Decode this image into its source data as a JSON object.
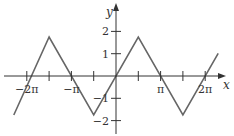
{
  "chart_data": {
    "type": "line",
    "title": "",
    "xlabel": "x",
    "ylabel": "y",
    "x_ticks": [
      {
        "value": -6.2832,
        "label": "−2π"
      },
      {
        "value": -4.7124,
        "label": ""
      },
      {
        "value": -3.1416,
        "label": "−π"
      },
      {
        "value": -1.5708,
        "label": ""
      },
      {
        "value": 1.5708,
        "label": ""
      },
      {
        "value": 3.1416,
        "label": "π"
      },
      {
        "value": 4.7124,
        "label": ""
      },
      {
        "value": 6.2832,
        "label": "2π"
      }
    ],
    "y_ticks": [
      {
        "value": 2,
        "label": "2"
      },
      {
        "value": 1,
        "label": "1"
      },
      {
        "value": -1,
        "label": "−1"
      },
      {
        "value": -2,
        "label": "−2"
      }
    ],
    "xlim": [
      -7.3,
      8.2
    ],
    "ylim": [
      -2.6,
      2.2
    ],
    "grid": false,
    "legend": null,
    "series": [
      {
        "name": "triangle wave",
        "color": "#666666",
        "x": [
          -7.2,
          -4.7124,
          -1.5708,
          1.5708,
          4.7124,
          7.2
        ],
        "y": [
          -1.75,
          1.75,
          -1.75,
          1.75,
          -1.75,
          1.02
        ]
      }
    ]
  },
  "axes": {
    "x_label": "x",
    "y_label": "y"
  },
  "colors": {
    "axis": "#333333",
    "curve": "#666666"
  }
}
